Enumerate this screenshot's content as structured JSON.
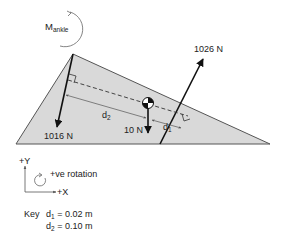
{
  "moment_label": {
    "main": "M",
    "sub": "ankle"
  },
  "forces": {
    "top_right": "1026 N",
    "bottom_left": "1016 N",
    "weight": "10 N"
  },
  "distances": {
    "d1": {
      "main": "d",
      "sub": "1"
    },
    "d2": {
      "main": "d",
      "sub": "2"
    }
  },
  "axes": {
    "y_label": "+Y",
    "x_label": "+X",
    "rotation_label": "+ve rotation"
  },
  "key": {
    "title": "Key",
    "d1": {
      "main": "d",
      "sub": "1",
      "value": " = 0.02 m"
    },
    "d2": {
      "main": "d",
      "sub": "2",
      "value": " = 0.10 m"
    }
  },
  "colors": {
    "foot_fill": "#d9d9d9",
    "foot_stroke": "#555555",
    "line": "#111111",
    "text": "#222222"
  }
}
